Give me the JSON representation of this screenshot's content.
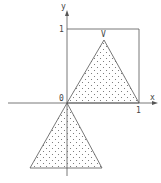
{
  "figure": {
    "axes": {
      "x_label": "x",
      "y_label": "y",
      "origin_label": "0",
      "x_tick_label": "1",
      "y_tick_label": "1"
    },
    "vertex_label": "V",
    "caption": "",
    "colors": {
      "line": "#555555",
      "dots": "#666666",
      "background": "#ffffff"
    },
    "shapes": [
      {
        "name": "unit-square",
        "description": "rectangle from (0,0) to (1,1)"
      },
      {
        "name": "upper-triangle",
        "vertices": [
          "(0,0)",
          "(1,0)",
          "V"
        ],
        "fill": "dotted"
      },
      {
        "name": "lower-triangle",
        "vertices": [
          "(0,0)",
          "bottom-left",
          "bottom-right"
        ],
        "fill": "dotted"
      }
    ]
  }
}
